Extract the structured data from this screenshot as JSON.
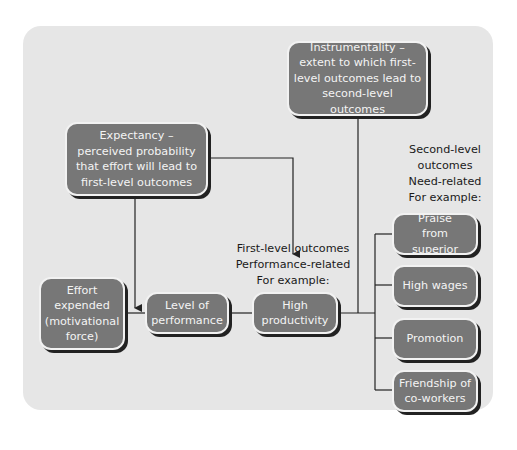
{
  "diagram": {
    "type": "expectancy-theory-model",
    "boxes": {
      "expectancy": "Expectancy – perceived probability that effort will lead to first-level outcomes",
      "instrumentality": "Instrumentality – extent to which first-level outcomes lead to second-level outcomes",
      "effort": "Effort expended (motivational force)",
      "performance": "Level of performance",
      "productivity": "High productivity",
      "praise": "Praise from superior",
      "wages": "High wages",
      "promotion": "Promotion",
      "friendship": "Friendship of co-workers"
    },
    "labels": {
      "first_level_1": "First-level outcomes",
      "first_level_2": "Performance-related",
      "first_level_3": "For example:",
      "second_level_1": "Second-level",
      "second_level_2": "outcomes",
      "second_level_3": "Need-related",
      "second_level_4": "For example:"
    },
    "colors": {
      "panel": "#e6e6e6",
      "box_fill": "#777777",
      "box_text": "#f4f4f4",
      "line": "#222222"
    }
  }
}
